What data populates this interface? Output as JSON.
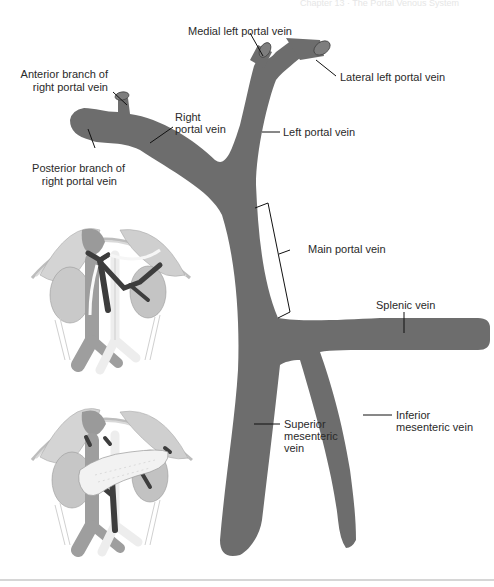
{
  "header": {
    "running_head": "Chapter 13 · The Portal Venous System"
  },
  "figure": {
    "vein_color": "#6d6d6d",
    "line_color": "#111111",
    "background": "#ffffff",
    "labels": {
      "medial_left": "Medial left portal vein",
      "lateral_left": "Lateral left portal vein",
      "anterior_right_1": "Anterior branch of",
      "anterior_right_2": "right portal vein",
      "right_pv_1": "Right",
      "right_pv_2": "portal vein",
      "left_pv": "Left portal vein",
      "posterior_right_1": "Posterior branch of",
      "posterior_right_2": "right portal vein",
      "main_pv": "Main portal vein",
      "splenic": "Splenic vein",
      "smv_1": "Superior",
      "smv_2": "mesenteric",
      "smv_3": "vein",
      "imv_1": "Inferior",
      "imv_2": "mesenteric vein"
    },
    "insets": [
      {
        "name": "abdominal-anatomy-without-pancreas",
        "description": "Abdominal organs with portal vein highlighted"
      },
      {
        "name": "abdominal-anatomy-with-pancreas",
        "description": "Abdominal organs with pancreas overlying portal vein"
      }
    ]
  }
}
